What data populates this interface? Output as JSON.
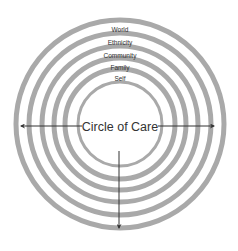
{
  "diagram": {
    "title": "Circle of Care",
    "center_label": "Circle of Care",
    "ring_color": "#a9a9a9",
    "arrow_color": "#333333",
    "rings": [
      {
        "label": "World"
      },
      {
        "label": "Ethnicity"
      },
      {
        "label": "Community"
      },
      {
        "label": "Family"
      },
      {
        "label": "Self"
      }
    ],
    "arrows": [
      {
        "direction": "left"
      },
      {
        "direction": "right"
      },
      {
        "direction": "down"
      }
    ]
  }
}
